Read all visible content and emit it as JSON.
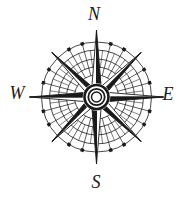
{
  "figure": {
    "type": "compass-rose",
    "background": "#ffffff",
    "ink": "#1a1a1a",
    "labels": {
      "north": "N",
      "east": "E",
      "south": "S",
      "west": "W"
    },
    "geometry": {
      "center": {
        "x": 96.5,
        "y": 97
      },
      "ring_radii": [
        55,
        47,
        38,
        30,
        22
      ],
      "tick_step_deg": 15,
      "half_tick_step_deg": 7.5,
      "dot_radius": 55,
      "dot_size": 3.4,
      "cardinal_angles_deg": [
        0,
        90,
        180,
        270
      ],
      "diagonal_angles_deg": [
        45,
        135,
        225,
        315
      ],
      "cardinal_point_length": 67,
      "cardinal_point_halfwidth": 5.5,
      "diagonal_point_length": 63,
      "diagonal_point_halfwidth": 5,
      "hub_mask_radius": 13.8,
      "hub_rings": [
        {
          "r": 12,
          "sw": 2.6
        },
        {
          "r": 8.2,
          "sw": 1.8
        },
        {
          "r": 5,
          "sw": 1.4
        }
      ]
    }
  }
}
